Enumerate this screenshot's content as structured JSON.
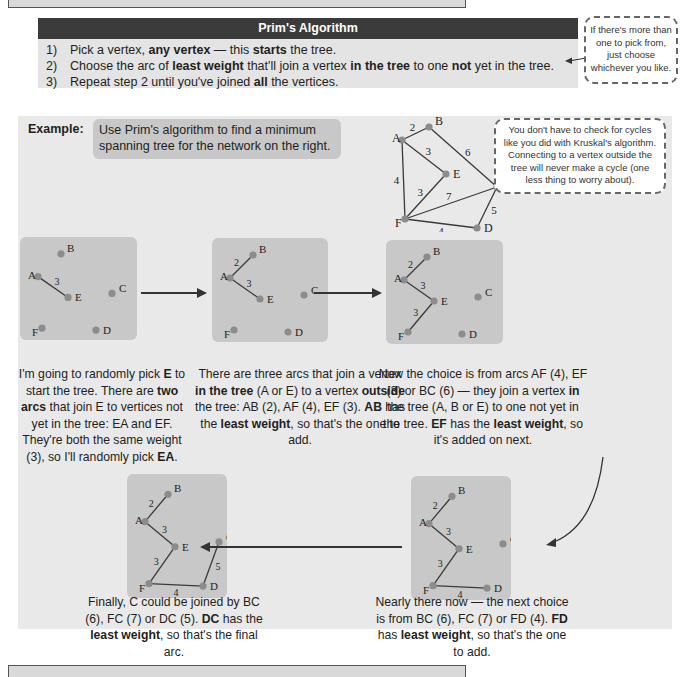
{
  "algorithm_box": {
    "title": "Prim's Algorithm",
    "steps": [
      {
        "num": "1)",
        "parts": [
          [
            "Pick a vertex, ",
            false
          ],
          [
            "any vertex",
            true
          ],
          [
            " — this ",
            false
          ],
          [
            "starts",
            true
          ],
          [
            " the tree.",
            false
          ]
        ]
      },
      {
        "num": "2)",
        "parts": [
          [
            "Choose the arc of ",
            false
          ],
          [
            "least weight",
            true
          ],
          [
            " that'll join a vertex ",
            false
          ],
          [
            "in the tree",
            true
          ],
          [
            " to one ",
            false
          ],
          [
            "not",
            true
          ],
          [
            " yet in the tree.",
            false
          ]
        ]
      },
      {
        "num": "3)",
        "parts": [
          [
            "Repeat step 2 until you've joined ",
            false
          ],
          [
            "all",
            true
          ],
          [
            " the vertices.",
            false
          ]
        ]
      }
    ]
  },
  "callout_choice": "If there's more than one to pick from, just choose whichever you like.",
  "callout_cycles": "You don't have to check for cycles like you did with Kruskal's algorithm. Connecting to a vertex outside the tree will never make a cycle (one less thing to worry about).",
  "example": {
    "label": "Example:",
    "task": "Use Prim's algorithm to find a minimum spanning tree for the network on the right."
  },
  "network": {
    "vertices": {
      "A": [
        15,
        21
      ],
      "B": [
        42,
        8
      ],
      "C": [
        110,
        68
      ],
      "D": [
        90,
        109
      ],
      "E": [
        59,
        55
      ],
      "F": [
        18,
        100
      ]
    },
    "edges": [
      [
        "A",
        "B",
        2
      ],
      [
        "B",
        "C",
        6
      ],
      [
        "A",
        "E",
        3
      ],
      [
        "A",
        "F",
        4
      ],
      [
        "F",
        "E",
        3
      ],
      [
        "F",
        "C",
        7
      ],
      [
        "C",
        "D",
        5
      ],
      [
        "F",
        "D",
        4
      ]
    ]
  },
  "steps": [
    {
      "caption": [
        [
          "I'm going to randomly pick ",
          false
        ],
        [
          "E",
          true
        ],
        [
          " to start the tree.  There are ",
          false
        ],
        [
          "two arcs",
          true
        ],
        [
          " that join E to vertices not yet in the tree:  EA and EF. They're both the same weight (3), so I'll randomly pick ",
          false
        ],
        [
          "EA",
          true
        ],
        [
          ".",
          false
        ]
      ],
      "tree_edges": [
        [
          "A",
          "E",
          3
        ]
      ]
    },
    {
      "caption": [
        [
          "There are three arcs that join a vertex ",
          false
        ],
        [
          "in the tree",
          true
        ],
        [
          " (A or E) to a vertex ",
          false
        ],
        [
          "outside",
          true
        ],
        [
          " the tree:  AB (2), AF (4), EF (3). ",
          false
        ],
        [
          "AB",
          true
        ],
        [
          " has the ",
          false
        ],
        [
          "least weight",
          true
        ],
        [
          ", so that's the one to add.",
          false
        ]
      ],
      "tree_edges": [
        [
          "A",
          "B",
          2
        ],
        [
          "A",
          "E",
          3
        ]
      ]
    },
    {
      "caption": [
        [
          "Now the choice is from arcs AF (4), EF (3) or BC (6) — they join a vertex ",
          false
        ],
        [
          "in",
          true
        ],
        [
          " the tree (A, B or E) to one not yet in the tree. ",
          false
        ],
        [
          "EF",
          true
        ],
        [
          " has the ",
          false
        ],
        [
          "least weight",
          true
        ],
        [
          ", so it's added on next.",
          false
        ]
      ],
      "tree_edges": [
        [
          "A",
          "B",
          2
        ],
        [
          "A",
          "E",
          3
        ],
        [
          "E",
          "F",
          3
        ]
      ]
    },
    {
      "caption": [
        [
          "Nearly there now — the next choice is from BC (6), FC (7) or FD (4).  ",
          false
        ],
        [
          "FD",
          true
        ],
        [
          " has ",
          false
        ],
        [
          "least weight",
          true
        ],
        [
          ", so that's the one to add.",
          false
        ]
      ],
      "tree_edges": [
        [
          "A",
          "B",
          2
        ],
        [
          "A",
          "E",
          3
        ],
        [
          "E",
          "F",
          3
        ],
        [
          "F",
          "D",
          4
        ]
      ]
    },
    {
      "caption": [
        [
          "Finally, C could be joined by BC (6), FC (7) or DC (5).  ",
          false
        ],
        [
          "DC",
          true
        ],
        [
          " has the ",
          false
        ],
        [
          "least weight",
          true
        ],
        [
          ", so that's the final arc.",
          false
        ]
      ],
      "tree_edges": [
        [
          "A",
          "B",
          2
        ],
        [
          "A",
          "E",
          3
        ],
        [
          "E",
          "F",
          3
        ],
        [
          "F",
          "D",
          4
        ],
        [
          "D",
          "C",
          5
        ]
      ]
    }
  ],
  "colors": {
    "header_bg": "#3b3b3b",
    "box_bg": "#e4e4e4",
    "panel_bg": "#c8c8c8",
    "vertex": "#8c8c8c",
    "edge": "#3a3a3a"
  }
}
